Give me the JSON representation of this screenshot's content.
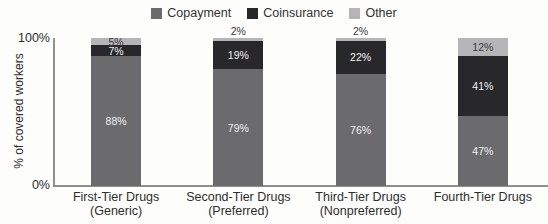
{
  "chart_data": {
    "type": "bar",
    "stacked": true,
    "orientation": "vertical",
    "title": "",
    "ylabel": "% of covered workers",
    "ylim": [
      0,
      100
    ],
    "ytick_top": "100%",
    "ytick_bottom": "0%",
    "grid": false,
    "legend_position": "top",
    "categories": [
      {
        "line1": "First-Tier Drugs",
        "line2": "(Generic)"
      },
      {
        "line1": "Second-Tier Drugs",
        "line2": "(Preferred)"
      },
      {
        "line1": "Third-Tier Drugs",
        "line2": "(Nonpreferred)"
      },
      {
        "line1": "Fourth-Tier Drugs",
        "line2": ""
      }
    ],
    "series": [
      {
        "name": "Copayment",
        "color": "#6b6b6d",
        "label_color": "#f2f2f2",
        "values": [
          88,
          79,
          76,
          47
        ],
        "value_labels": [
          "88%",
          "79%",
          "76%",
          "47%"
        ]
      },
      {
        "name": "Coinsurance",
        "color": "#28282b",
        "label_color": "#f2f2f2",
        "values": [
          7,
          19,
          22,
          41
        ],
        "value_labels": [
          "7%",
          "19%",
          "22%",
          "41%"
        ]
      },
      {
        "name": "Other",
        "color": "#b5b5b7",
        "label_color": "#3a3a3a",
        "values": [
          5,
          2,
          2,
          12
        ],
        "value_labels": [
          "5%",
          "2%",
          "2%",
          "12%"
        ]
      }
    ]
  },
  "colors": {
    "axis": "#8f8f8f",
    "text": "#2e2e2e",
    "background": "#fdfdfc"
  }
}
